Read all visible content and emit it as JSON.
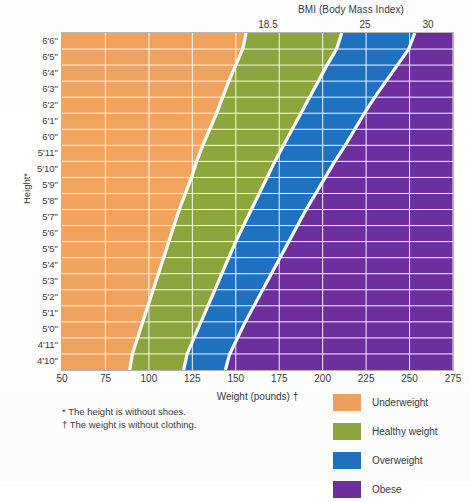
{
  "header": {
    "bmi_title": "BMI (Body Mass Index)",
    "bmi_ticks": [
      {
        "label": "18.5",
        "x": 268
      },
      {
        "label": "25",
        "x": 365
      },
      {
        "label": "30",
        "x": 428
      }
    ]
  },
  "axes": {
    "y_title": "Height*",
    "x_title": "Weight (pounds) †"
  },
  "footnotes": {
    "height_note": "* The height is without shoes.",
    "weight_note": "† The weight is without clothing."
  },
  "legend": {
    "items": [
      {
        "label": "Underweight",
        "color": "#efa45f"
      },
      {
        "label": "Healthy weight",
        "color": "#8ea63e"
      },
      {
        "label": "Overweight",
        "color": "#1f72c0"
      },
      {
        "label": "Obese",
        "color": "#6e2f9e"
      }
    ]
  },
  "chart_data": {
    "type": "heatmap",
    "title": "BMI (Body Mass Index)",
    "xlabel": "Weight (pounds) †",
    "ylabel": "Height*",
    "xlim": [
      50,
      275
    ],
    "ylim_labels": [
      "4'10\"",
      "6'6\""
    ],
    "grid": true,
    "legend_position": "bottom-right",
    "x_ticks": [
      50,
      75,
      100,
      125,
      150,
      175,
      200,
      225,
      250,
      275
    ],
    "y_ticks": [
      "6'6\"",
      "6'5\"",
      "6'4\"",
      "6'3\"",
      "6'2\"",
      "6'1\"",
      "6'0\"",
      "5'11\"",
      "5'10\"",
      "5'9\"",
      "5'8\"",
      "5'7\"",
      "5'6\"",
      "5'5\"",
      "5'4\"",
      "5'3\"",
      "5'2\"",
      "5'1\"",
      "5'0\"",
      "4'11\"",
      "4'10\""
    ],
    "bmi_boundaries": [
      18.5,
      25,
      30
    ],
    "categories": [
      {
        "name": "Underweight",
        "bmi_range": "under 18.5",
        "color": "#efa45f"
      },
      {
        "name": "Healthy weight",
        "bmi_range": "18.5 - 25",
        "color": "#8ea63e"
      },
      {
        "name": "Overweight",
        "bmi_range": "25 - 30",
        "color": "#1f72c0"
      },
      {
        "name": "Obese",
        "bmi_range": "30 and over",
        "color": "#6e2f9e"
      }
    ],
    "boundary_weights_lb": [
      {
        "height": "6'6\"",
        "bmi18_5": 156,
        "bmi25": 211,
        "bmi30": 253
      },
      {
        "height": "6'5\"",
        "bmi18_5": 152,
        "bmi25": 205,
        "bmi30": 246
      },
      {
        "height": "6'4\"",
        "bmi18_5": 148,
        "bmi25": 200,
        "bmi30": 240
      },
      {
        "height": "6'3\"",
        "bmi18_5": 144,
        "bmi25": 195,
        "bmi30": 233
      },
      {
        "height": "6'2\"",
        "bmi18_5": 141,
        "bmi25": 190,
        "bmi30": 227
      },
      {
        "height": "6'1\"",
        "bmi18_5": 137,
        "bmi25": 185,
        "bmi30": 221
      },
      {
        "height": "6'0\"",
        "bmi18_5": 133,
        "bmi25": 180,
        "bmi30": 216
      },
      {
        "height": "5'11\"",
        "bmi18_5": 129,
        "bmi25": 175,
        "bmi30": 210
      },
      {
        "height": "5'10\"",
        "bmi18_5": 126,
        "bmi25": 170,
        "bmi30": 204
      },
      {
        "height": "5'9\"",
        "bmi18_5": 123,
        "bmi25": 166,
        "bmi30": 199
      },
      {
        "height": "5'8\"",
        "bmi18_5": 119,
        "bmi25": 161,
        "bmi30": 193
      },
      {
        "height": "5'7\"",
        "bmi18_5": 116,
        "bmi25": 157,
        "bmi30": 188
      },
      {
        "height": "5'6\"",
        "bmi18_5": 113,
        "bmi25": 152,
        "bmi30": 183
      },
      {
        "height": "5'5\"",
        "bmi18_5": 110,
        "bmi25": 148,
        "bmi30": 178
      },
      {
        "height": "5'4\"",
        "bmi18_5": 107,
        "bmi25": 144,
        "bmi30": 173
      },
      {
        "height": "5'3\"",
        "bmi18_5": 104,
        "bmi25": 140,
        "bmi30": 168
      },
      {
        "height": "5'2\"",
        "bmi18_5": 101,
        "bmi25": 136,
        "bmi30": 163
      },
      {
        "height": "5'1\"",
        "bmi18_5": 98,
        "bmi25": 132,
        "bmi30": 158
      },
      {
        "height": "5'0\"",
        "bmi18_5": 95,
        "bmi25": 128,
        "bmi30": 153
      },
      {
        "height": "4'11\"",
        "bmi18_5": 92,
        "bmi25": 124,
        "bmi30": 149
      },
      {
        "height": "4'10\"",
        "bmi18_5": 89,
        "bmi25": 120,
        "bmi30": 144
      }
    ]
  },
  "style": {
    "plot_background": "#f3f0ea",
    "grid_color": "#ffffff",
    "border_color": "#b9b6b0",
    "text_color": "#3c3c3c"
  }
}
